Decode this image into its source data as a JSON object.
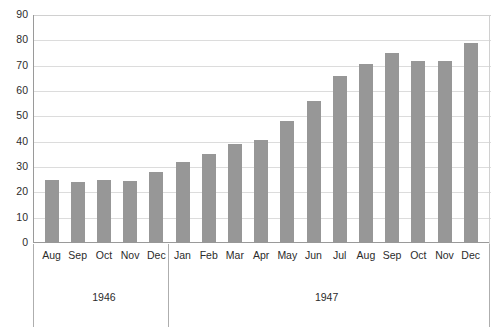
{
  "chart_data": {
    "type": "bar",
    "title": "",
    "xlabel": "",
    "ylabel": "",
    "ylim": [
      0,
      90
    ],
    "y_ticks": [
      0,
      10,
      20,
      30,
      40,
      50,
      60,
      70,
      80,
      90
    ],
    "grid": true,
    "legend": "none",
    "bar_color": "#979797",
    "gridline_color": "#dcdcdc",
    "axis_color": "#9a9a9a",
    "categories": [
      "Aug",
      "Sep",
      "Oct",
      "Nov",
      "Dec",
      "Jan",
      "Feb",
      "Mar",
      "Apr",
      "May",
      "Jun",
      "Jul",
      "Aug",
      "Sep",
      "Oct",
      "Nov",
      "Dec"
    ],
    "values": [
      25,
      24,
      25,
      24.5,
      28,
      32,
      35,
      39,
      40.5,
      48,
      56,
      66,
      70.5,
      75,
      72,
      72,
      79
    ],
    "groups": [
      {
        "label": "1946",
        "start_index": 0,
        "count": 5
      },
      {
        "label": "1947",
        "start_index": 5,
        "count": 12
      }
    ]
  }
}
